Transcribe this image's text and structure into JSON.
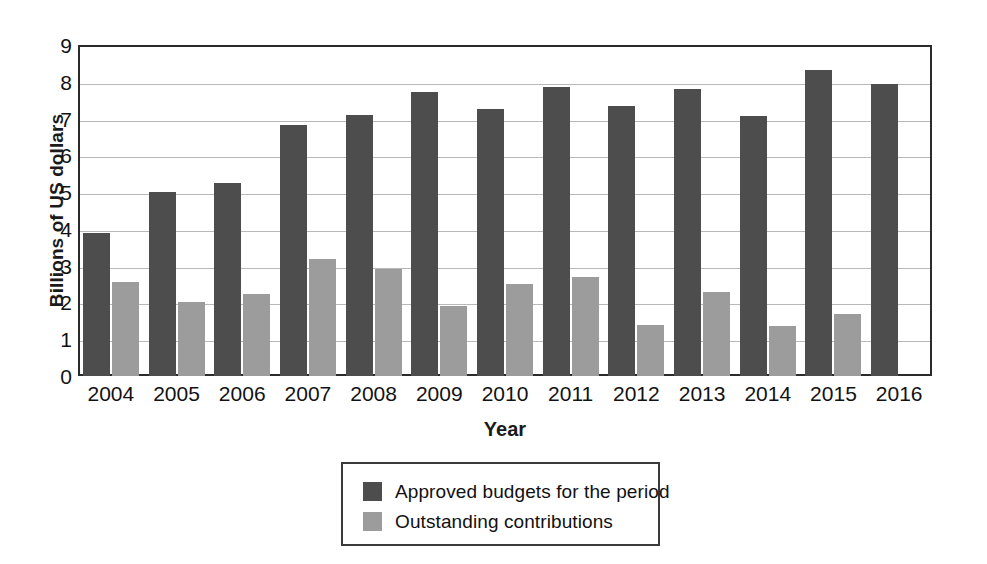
{
  "chart_data": {
    "type": "bar",
    "title": "",
    "xlabel": "Year",
    "ylabel": "Billions of US dollars",
    "ylim": [
      0,
      9
    ],
    "yticks": [
      0,
      1,
      2,
      3,
      4,
      5,
      6,
      7,
      8,
      9
    ],
    "ytick_labels": [
      "0",
      "1",
      "2",
      "3",
      "4",
      "5",
      "6",
      "7",
      "8",
      "9"
    ],
    "grid": true,
    "legend_position": "bottom-center",
    "categories": [
      "2004",
      "2005",
      "2006",
      "2007",
      "2008",
      "2009",
      "2010",
      "2011",
      "2012",
      "2013",
      "2014",
      "2015",
      "2016"
    ],
    "series": [
      {
        "name": "Approved budgets for the period",
        "color": "#4d4d4d",
        "values": [
          3.88,
          5.0,
          5.25,
          6.82,
          7.1,
          7.72,
          7.25,
          7.87,
          7.35,
          7.8,
          7.08,
          8.33,
          7.95
        ]
      },
      {
        "name": "Outstanding contributions",
        "color": "#9c9c9c",
        "values": [
          2.55,
          2.02,
          2.22,
          3.18,
          2.9,
          1.9,
          2.5,
          2.68,
          1.4,
          2.28,
          1.35,
          1.68,
          null
        ]
      }
    ]
  },
  "legend": {
    "entries": [
      {
        "label": "Approved budgets for the period",
        "color": "#4d4d4d",
        "swatch": "dark"
      },
      {
        "label": "Outstanding contributions",
        "color": "#9c9c9c",
        "swatch": "light"
      }
    ]
  },
  "axes": {
    "y_title": "Billions of US dollars",
    "x_title": "Year"
  },
  "colors": {
    "series_dark": "#4d4d4d",
    "series_light": "#9c9c9c",
    "frame": "#2b2b2b",
    "gridline": "#b9b9b9",
    "text": "#121212",
    "background": "#ffffff"
  }
}
